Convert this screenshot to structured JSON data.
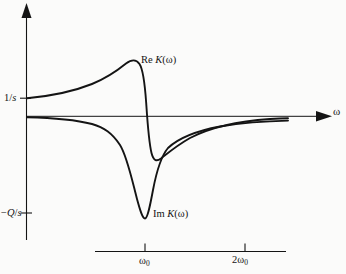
{
  "figure": {
    "kind": "line-plot",
    "background_color": "#fbfbfa",
    "line_color": "#141414"
  },
  "axes": {
    "vertical": {
      "name": "vertical-axis",
      "arrow": "up",
      "tick_labels": [
        {
          "text_html": "1/<i>s</i>",
          "plain": "1/s",
          "y_px": 98
        },
        {
          "text_html": "&minus;<i>Q</i>/<i>s</i>",
          "plain": "-Q/s",
          "y_px": 213
        }
      ]
    },
    "horizontal": {
      "name": "horizontal-axis",
      "arrow": "right",
      "label_html": "&omega;",
      "label_plain": "omega",
      "zero_level_y_px": 116
    },
    "scale_bar": {
      "name": "frequency-scale-bar",
      "ticks": [
        {
          "label_html": "&omega;<sub>0</sub>",
          "plain": "omega_0",
          "x_px": 145
        },
        {
          "label_html": "2&omega;<sub>0</sub>",
          "plain": "2 omega_0",
          "x_px": 245
        }
      ]
    }
  },
  "curve_labels": {
    "real": {
      "prefix": "Re",
      "func": "K",
      "arg": "ω",
      "html": "Re <i>K</i>(&omega;)",
      "plain": "Re K(ω)"
    },
    "imag": {
      "prefix": "Im",
      "func": "K",
      "arg": "ω",
      "html": "Im <i>K</i>(&omega;)",
      "plain": "Im K(ω)"
    }
  },
  "chart_data": {
    "type": "line",
    "title": "",
    "xlabel": "ω",
    "ylabel": "",
    "grid": false,
    "legend": "inline-annotations",
    "xlim": [
      0,
      3.0
    ],
    "ylim": [
      -1.0,
      0.62
    ],
    "x_ticks": [
      {
        "value": 1.0,
        "label": "ω₀"
      },
      {
        "value": 2.0,
        "label": "2ω₀"
      }
    ],
    "y_ticks": [
      {
        "value": 0.155,
        "label": "1/s"
      },
      {
        "value": -0.83,
        "label": "-Q/s"
      }
    ],
    "series": [
      {
        "name": "Re K(ω)",
        "label": "Re K(ω)",
        "description": "Dispersive real part: starts at 1/s at ω=0, rises to a positive maximum just below ω₀, falls steeply through zero at ω₀ to a negative minimum just above ω₀, then rises asymptotically toward zero from below.",
        "x": [
          0.0,
          0.2,
          0.4,
          0.55,
          0.7,
          0.8,
          0.86,
          0.9,
          0.94,
          0.97,
          1.0,
          1.03,
          1.06,
          1.1,
          1.16,
          1.25,
          1.4,
          1.6,
          1.9,
          2.3,
          2.75
        ],
        "y": [
          0.155,
          0.185,
          0.235,
          0.3,
          0.4,
          0.49,
          0.545,
          0.56,
          0.53,
          0.4,
          0.0,
          -0.33,
          -0.25,
          -0.3,
          -0.31,
          -0.27,
          -0.2,
          -0.14,
          -0.09,
          -0.055,
          -0.04
        ]
      },
      {
        "name": "Im K(ω)",
        "label": "Im K(ω)",
        "description": "Absorptive imaginary part: essentially zero at low ω, dips to a deep negative minimum -Q/s at ω₀, then recovers asymptotically toward zero from below.",
        "x": [
          0.0,
          0.25,
          0.45,
          0.6,
          0.7,
          0.78,
          0.84,
          0.9,
          0.95,
          1.0,
          1.05,
          1.1,
          1.18,
          1.3,
          1.5,
          1.75,
          2.05,
          2.4,
          2.75
        ],
        "y": [
          -0.005,
          -0.012,
          -0.03,
          -0.065,
          -0.11,
          -0.2,
          -0.33,
          -0.52,
          -0.72,
          -0.83,
          -0.69,
          -0.47,
          -0.33,
          -0.27,
          -0.21,
          -0.165,
          -0.13,
          -0.11,
          -0.1
        ]
      }
    ]
  }
}
